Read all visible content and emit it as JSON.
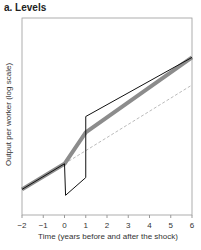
{
  "panel_title": "a. Levels",
  "chart_data": {
    "type": "line",
    "title": "a. Levels",
    "xlabel": "Time (years before and after the shock)",
    "ylabel": "Output per worker (log scale)",
    "xlim": [
      -2,
      6
    ],
    "x_ticks": [
      "-2",
      "-1",
      "0",
      "1",
      "2",
      "3",
      "4",
      "5",
      "6"
    ],
    "grid": false,
    "series": [
      {
        "name": "smoothed path (thick gray)",
        "color": "#8c8c8c",
        "x": [
          -2,
          0,
          1,
          6
        ],
        "y": [
          0.13,
          0.26,
          0.42,
          0.8
        ]
      },
      {
        "name": "actual path (thin black)",
        "color": "#111111",
        "x": [
          -2,
          0,
          0.05,
          1,
          1,
          6
        ],
        "y": [
          0.13,
          0.26,
          0.1,
          0.19,
          0.5,
          0.8
        ]
      },
      {
        "name": "pre-shock trend (dashed)",
        "color": "#bbbbbb",
        "x": [
          0,
          6
        ],
        "y": [
          0.26,
          0.66
        ]
      }
    ]
  }
}
